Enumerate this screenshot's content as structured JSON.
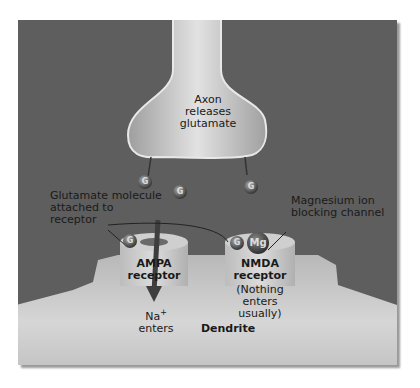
{
  "diagram": {
    "axon_label": [
      "Axon",
      "releases",
      "glutamate"
    ],
    "glutamate_label": [
      "Glutamate molecule",
      "attached to",
      "receptor"
    ],
    "magnesium_label": [
      "Magnesium ion",
      "blocking channel"
    ],
    "ampa_label": [
      "AMPA",
      "receptor"
    ],
    "nmda_label": [
      "NMDA",
      "receptor"
    ],
    "nmda_note": [
      "(Nothing enters",
      "usually)"
    ],
    "sodium_label": "Na",
    "sodium_charge": "+",
    "sodium_enters": "enters",
    "dendrite_label": "Dendrite",
    "glutamate_symbol": "G",
    "magnesium_symbol": "Mg"
  },
  "colors": {
    "background": "#5e5e5e",
    "membrane": "#d0d0d0",
    "molecule": "#3a3a3a"
  }
}
